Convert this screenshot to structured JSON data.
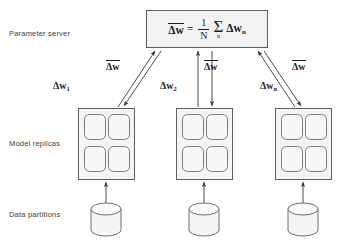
{
  "diagram": {
    "row_labels": {
      "parameter_server": "Parameter server",
      "model_replicas": "Model replicas",
      "data_partitions": "Data partitions"
    },
    "parameter_server": {
      "formula_text": "Δw̄ = (1/N) Σₙ Δwₙ",
      "lhs": "Δw",
      "equals": "=",
      "fraction_numerator": "1",
      "fraction_denominator": "N",
      "sigma": "Σ",
      "sigma_index": "n",
      "rhs_term": "Δw",
      "rhs_subscript": "n"
    },
    "gradient_labels": [
      {
        "id": "dw1",
        "base": "Δw",
        "subscript": "1",
        "overbar": false
      },
      {
        "id": "dw2",
        "base": "Δw",
        "subscript": "2",
        "overbar": false
      },
      {
        "id": "dwn",
        "base": "Δw",
        "subscript": "n",
        "overbar": false
      }
    ],
    "broadcast_labels": [
      {
        "id": "bar-a",
        "base": "Δw",
        "overbar": true
      },
      {
        "id": "bar-b",
        "base": "Δw",
        "overbar": true
      },
      {
        "id": "bar-c",
        "base": "Δw",
        "overbar": true
      }
    ],
    "replicas": [
      {
        "id": "replica-1",
        "cells": 4
      },
      {
        "id": "replica-2",
        "cells": 4
      },
      {
        "id": "replica-n",
        "cells": 4
      }
    ],
    "partitions": [
      {
        "id": "partition-1"
      },
      {
        "id": "partition-2"
      },
      {
        "id": "partition-n"
      }
    ],
    "caption": "",
    "colors": {
      "stroke": "#6e6e6e",
      "box_fill": "#f2f2f2",
      "cell_fill": "#f5f5f5",
      "text": "#1c1c1c",
      "label_text": "#3d3d3d",
      "background": "#ffffff"
    }
  }
}
